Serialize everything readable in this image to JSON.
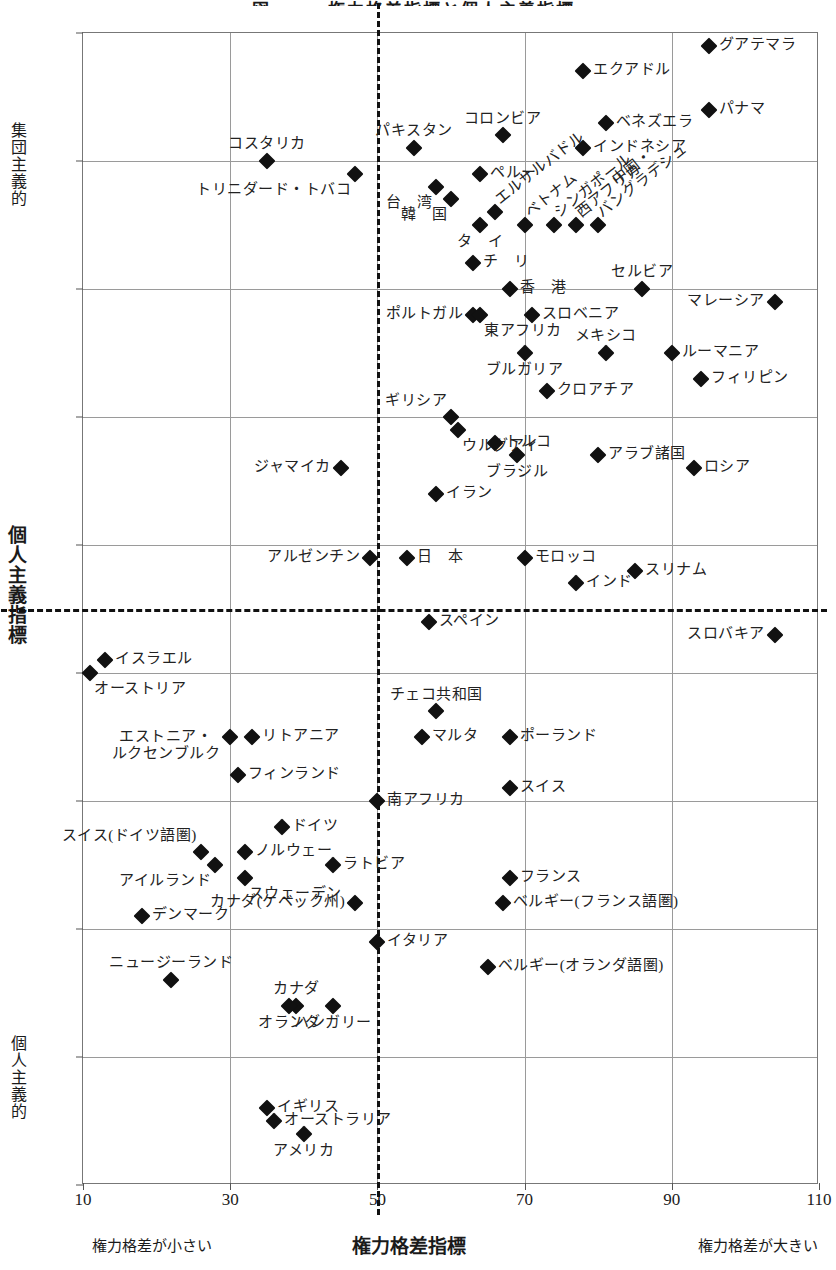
{
  "chart_data": {
    "type": "scatter",
    "title": "図　　　権力格差指標と個人主義指標",
    "xlabel": "権力格差指標",
    "ylabel": "個人主義指標",
    "xlim": [
      10,
      110
    ],
    "ylim": [
      5,
      95
    ],
    "y_inverted": true,
    "grid": true,
    "legend": "none",
    "x_ticks": [
      10,
      30,
      50,
      70,
      90,
      110
    ],
    "y_ticks": [
      5,
      15,
      25,
      35,
      45,
      55,
      65,
      75,
      85,
      95
    ],
    "x_note_left": "権力格差が小さい",
    "x_note_right": "権力格差が大きい",
    "y_note_top": "集団主義的",
    "y_note_bottom": "個人主義的",
    "reference_lines": {
      "x": 50,
      "y": 50
    },
    "points": [
      {
        "label": "グアテマラ",
        "x": 95,
        "y": 6,
        "pos": "r"
      },
      {
        "label": "エクアドル",
        "x": 78,
        "y": 8,
        "pos": "r"
      },
      {
        "label": "パナマ",
        "x": 95,
        "y": 11,
        "pos": "r"
      },
      {
        "label": "ベネズエラ",
        "x": 81,
        "y": 12,
        "pos": "r"
      },
      {
        "label": "コロンビア",
        "x": 67,
        "y": 13,
        "pos": "t"
      },
      {
        "label": "パキスタン",
        "x": 55,
        "y": 14,
        "pos": "t"
      },
      {
        "label": "インドネシア",
        "x": 78,
        "y": 14,
        "pos": "r"
      },
      {
        "label": "コスタリカ",
        "x": 35,
        "y": 15,
        "pos": "t"
      },
      {
        "label": "トリニダード・トバコ",
        "x": 47,
        "y": 16,
        "pos": "bl"
      },
      {
        "label": "ペルー",
        "x": 64,
        "y": 16,
        "pos": "r"
      },
      {
        "label": "台　湾",
        "x": 58,
        "y": 17,
        "pos": "bl"
      },
      {
        "label": "韓　国",
        "x": 60,
        "y": 18,
        "pos": "bl"
      },
      {
        "label": "エルサルバドル",
        "x": 66,
        "y": 19,
        "pos": "diag"
      },
      {
        "label": "タ　イ",
        "x": 64,
        "y": 20,
        "pos": "b"
      },
      {
        "label": "ベトナム",
        "x": 70,
        "y": 20,
        "pos": "diag"
      },
      {
        "label": "シンガポール",
        "x": 74,
        "y": 20,
        "pos": "diag"
      },
      {
        "label": "西アフリカ",
        "x": 77,
        "y": 20,
        "pos": "diag"
      },
      {
        "label": "中国・\nバングラデシュ",
        "x": 80,
        "y": 20,
        "pos": "diag"
      },
      {
        "label": "チ　リ",
        "x": 63,
        "y": 23,
        "pos": "r"
      },
      {
        "label": "香　港",
        "x": 68,
        "y": 25,
        "pos": "r"
      },
      {
        "label": "セルビア",
        "x": 86,
        "y": 25,
        "pos": "t"
      },
      {
        "label": "ポルトガル",
        "x": 63,
        "y": 27,
        "pos": "l"
      },
      {
        "label": "東アフリカ",
        "x": 64,
        "y": 27,
        "pos": "br"
      },
      {
        "label": "スロベニア",
        "x": 71,
        "y": 27,
        "pos": "r"
      },
      {
        "label": "マレーシア",
        "x": 104,
        "y": 26,
        "pos": "l"
      },
      {
        "label": "ブルガリア",
        "x": 70,
        "y": 30,
        "pos": "b"
      },
      {
        "label": "メキシコ",
        "x": 81,
        "y": 30,
        "pos": "t"
      },
      {
        "label": "ルーマニア",
        "x": 90,
        "y": 30,
        "pos": "r"
      },
      {
        "label": "フィリピン",
        "x": 94,
        "y": 32,
        "pos": "r"
      },
      {
        "label": "クロアチア",
        "x": 73,
        "y": 33,
        "pos": "r"
      },
      {
        "label": "ギリシア",
        "x": 60,
        "y": 35,
        "pos": "tl"
      },
      {
        "label": "ウルグアイ",
        "x": 61,
        "y": 36,
        "pos": "br"
      },
      {
        "label": "トルコ",
        "x": 66,
        "y": 37,
        "pos": "r"
      },
      {
        "label": "アラブ諸国",
        "x": 80,
        "y": 38,
        "pos": "r"
      },
      {
        "label": "ジャマイカ",
        "x": 45,
        "y": 39,
        "pos": "l"
      },
      {
        "label": "ブラジル",
        "x": 69,
        "y": 38,
        "pos": "b"
      },
      {
        "label": "ロシア",
        "x": 93,
        "y": 39,
        "pos": "r"
      },
      {
        "label": "イラン",
        "x": 58,
        "y": 41,
        "pos": "r"
      },
      {
        "label": "アルゼンチン",
        "x": 49,
        "y": 46,
        "pos": "l"
      },
      {
        "label": "日　本",
        "x": 54,
        "y": 46,
        "pos": "r"
      },
      {
        "label": "モロッコ",
        "x": 70,
        "y": 46,
        "pos": "r"
      },
      {
        "label": "スリナム",
        "x": 85,
        "y": 47,
        "pos": "r"
      },
      {
        "label": "インド",
        "x": 77,
        "y": 48,
        "pos": "r"
      },
      {
        "label": "スペイン",
        "x": 57,
        "y": 51,
        "pos": "r"
      },
      {
        "label": "スロバキア",
        "x": 104,
        "y": 52,
        "pos": "l"
      },
      {
        "label": "イスラエル",
        "x": 13,
        "y": 54,
        "pos": "r"
      },
      {
        "label": "オーストリア",
        "x": 11,
        "y": 55,
        "pos": "br"
      },
      {
        "label": "チェコ共和国",
        "x": 58,
        "y": 58,
        "pos": "t"
      },
      {
        "label": "マルタ",
        "x": 56,
        "y": 60,
        "pos": "r"
      },
      {
        "label": "エストニア・\nルクセンブルク",
        "x": 30,
        "y": 60,
        "pos": "l"
      },
      {
        "label": "リトアニア",
        "x": 33,
        "y": 60,
        "pos": "r"
      },
      {
        "label": "ポーランド",
        "x": 68,
        "y": 60,
        "pos": "r"
      },
      {
        "label": "フィンランド",
        "x": 31,
        "y": 63,
        "pos": "r"
      },
      {
        "label": "スイス",
        "x": 68,
        "y": 64,
        "pos": "r"
      },
      {
        "label": "南アフリカ",
        "x": 50,
        "y": 65,
        "pos": "r"
      },
      {
        "label": "ドイツ",
        "x": 37,
        "y": 67,
        "pos": "r"
      },
      {
        "label": "スイス(ドイツ語圏)",
        "x": 26,
        "y": 69,
        "pos": "tl"
      },
      {
        "label": "ノルウェー",
        "x": 32,
        "y": 69,
        "pos": "r"
      },
      {
        "label": "ラトビア",
        "x": 44,
        "y": 70,
        "pos": "r"
      },
      {
        "label": "アイルランド",
        "x": 28,
        "y": 70,
        "pos": "bl"
      },
      {
        "label": "スウェーデン",
        "x": 32,
        "y": 71,
        "pos": "br"
      },
      {
        "label": "デンマーク",
        "x": 18,
        "y": 74,
        "pos": "r"
      },
      {
        "label": "カナダ(ケベック州)",
        "x": 47,
        "y": 73,
        "pos": "l"
      },
      {
        "label": "イタリア",
        "x": 50,
        "y": 76,
        "pos": "r"
      },
      {
        "label": "ベルギー(オランダ語圏)",
        "x": 65,
        "y": 78,
        "pos": "r"
      },
      {
        "label": "フランス",
        "x": 68,
        "y": 71,
        "pos": "r"
      },
      {
        "label": "ベルギー(フランス語圏)",
        "x": 67,
        "y": 73,
        "pos": "r"
      },
      {
        "label": "ニュージーランド",
        "x": 22,
        "y": 79,
        "pos": "t"
      },
      {
        "label": "カナダ",
        "x": 39,
        "y": 81,
        "pos": "t"
      },
      {
        "label": "オランダ",
        "x": 38,
        "y": 81,
        "pos": "b"
      },
      {
        "label": "ハンガリー",
        "x": 44,
        "y": 81,
        "pos": "b"
      },
      {
        "label": "イギリス",
        "x": 35,
        "y": 89,
        "pos": "r"
      },
      {
        "label": "オーストラリア",
        "x": 36,
        "y": 90,
        "pos": "r"
      },
      {
        "label": "アメリカ",
        "x": 40,
        "y": 91,
        "pos": "b"
      }
    ]
  }
}
